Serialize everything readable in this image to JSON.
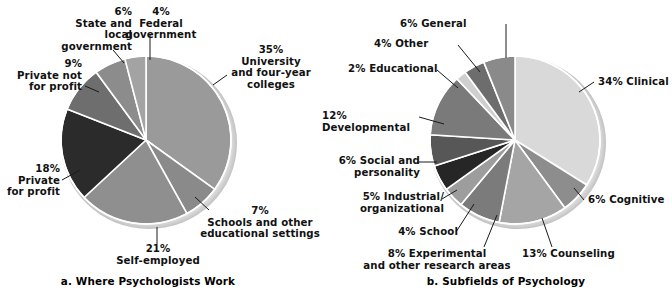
{
  "figure": {
    "background": "#ffffff",
    "width": 672,
    "height": 302
  },
  "chart_data": [
    {
      "type": "pie",
      "id": "where-psychologists-work",
      "title": "a. Where Psychologists Work",
      "panel_letter": "a.",
      "unit": "percent",
      "total": 100,
      "start_angle_deg": -90,
      "direction": "clockwise",
      "categories": [
        "University and four-year colleges",
        "Schools and other educational settings",
        "Self-employed",
        "Private for profit",
        "Private not for profit",
        "State and local government",
        "Federal government"
      ],
      "values": [
        35,
        7,
        21,
        18,
        9,
        6,
        4
      ],
      "colors": [
        "#9a9a9a",
        "#8a8a8a",
        "#8f8f8f",
        "#2b2b2b",
        "#6e6e6e",
        "#8c8c8c",
        "#a3a3a3"
      ],
      "labels": [
        {
          "pct": "35%",
          "text": "University\nand four-year\ncolleges",
          "full": "35% University and four-year colleges"
        },
        {
          "pct": "7%",
          "text": "Schools and other\neducational settings",
          "full": "7% Schools and other educational settings"
        },
        {
          "pct": "21%",
          "text": "Self-employed",
          "full": "21% Self-employed"
        },
        {
          "pct": "18%",
          "text": "Private\nfor profit",
          "full": "18% Private for profit"
        },
        {
          "pct": "9%",
          "text": "Private not\nfor profit",
          "full": "9% Private not for profit"
        },
        {
          "pct": "6%",
          "text": "State and\nlocal\ngovernment",
          "full": "6% State and local government"
        },
        {
          "pct": "4%",
          "text": "Federal\ngovernment",
          "full": "4% Federal government"
        }
      ],
      "legend": "none",
      "grid": false
    },
    {
      "type": "pie",
      "id": "subfields-of-psychology",
      "title": "b. Subfields of Psychology",
      "panel_letter": "b.",
      "unit": "percent",
      "total": 100,
      "start_angle_deg": -90,
      "direction": "clockwise",
      "categories": [
        "Clinical",
        "Cognitive",
        "Counseling",
        "Experimental and other research areas",
        "School",
        "Industrial/organizational",
        "Social and personality",
        "Developmental",
        "Educational",
        "Other",
        "General"
      ],
      "values": [
        34,
        6,
        13,
        8,
        4,
        5,
        6,
        12,
        2,
        4,
        6
      ],
      "colors": [
        "#d9d9d9",
        "#8d8d8d",
        "#a5a5a5",
        "#7b7b7b",
        "#9d9d9d",
        "#262626",
        "#575757",
        "#7a7a7a",
        "#cfcfcf",
        "#6d6d6d",
        "#8a8a8a"
      ],
      "labels": [
        {
          "full": "34% Clinical"
        },
        {
          "full": "6% Cognitive"
        },
        {
          "full": "13% Counseling"
        },
        {
          "full": "8% Experimental\nand other research areas"
        },
        {
          "full": "4% School"
        },
        {
          "full": "5% Industrial/\norganizational"
        },
        {
          "full": "6% Social and\npersonality"
        },
        {
          "full": "12% Developmental"
        },
        {
          "full": "2% Educational"
        },
        {
          "full": "4% Other"
        },
        {
          "full": "6% General"
        }
      ],
      "legend": "none",
      "grid": false
    }
  ],
  "panel_a": {
    "caption": "a. Where Psychologists Work",
    "labels": {
      "state_local": "6%\nState and\nlocal\ngovernment",
      "federal": "4%\nFederal\ngovernment",
      "private_not_for_profit": "9%\nPrivate not\nfor profit",
      "private_for_profit": "18%\nPrivate\nfor profit",
      "university": "35%\nUniversity\nand four-year\ncolleges",
      "schools_other": "7%\nSchools and other\neducational settings",
      "self_employed": "21%\nSelf-employed"
    }
  },
  "panel_b": {
    "caption": "b. Subfields of Psychology",
    "labels": {
      "general": "6% General",
      "other": "4% Other",
      "educational": "2% Educational",
      "developmental": "12% Developmental",
      "social_personality": "6% Social and\npersonality",
      "industrial": "5% Industrial/\norganizational",
      "school": "4% School",
      "experimental": "8% Experimental\nand other research areas",
      "counseling": "13% Counseling",
      "cognitive": "6% Cognitive",
      "clinical": "34% Clinical"
    }
  }
}
